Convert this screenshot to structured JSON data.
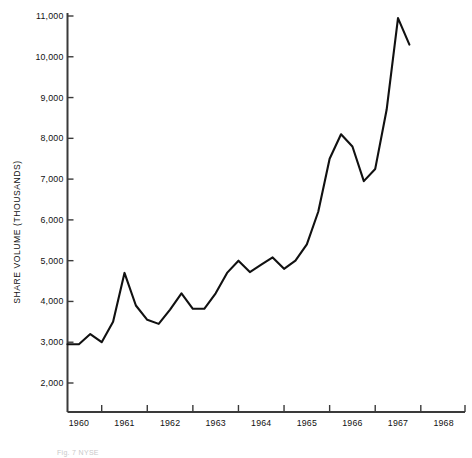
{
  "figure": {
    "caption_fragment": "Fig. 7  NYSE",
    "background_color": "#ffffff",
    "line_color": "#111111",
    "axis_color": "#3a3a3a"
  },
  "chart_data": {
    "type": "line",
    "title": "",
    "subtitle": "",
    "xlabel": "",
    "ylabel": "SHARE VOLUME (THOUSANDS)",
    "grid": false,
    "legend": "none",
    "ylim": [
      1500,
      11000
    ],
    "xlim": [
      1959.75,
      1968.25
    ],
    "y_ticks": [
      2000,
      3000,
      4000,
      5000,
      6000,
      7000,
      8000,
      9000,
      10000,
      11000
    ],
    "y_tick_labels": [
      "2,000",
      "3,000",
      "4,000",
      "5,000",
      "6,000",
      "7,000",
      "8,000",
      "9,000",
      "10,000",
      "11,000"
    ],
    "x_ticks": [
      1960,
      1961,
      1962,
      1963,
      1964,
      1965,
      1966,
      1967,
      1968
    ],
    "x_tick_labels": [
      "1960",
      "1961",
      "1962",
      "1963",
      "1964",
      "1965",
      "1966",
      "1967",
      "1968"
    ],
    "x_minor_ticks": [
      1960.5,
      1961.5,
      1962.5,
      1963.5,
      1964.5,
      1965.5,
      1966.5,
      1967.5
    ],
    "series": [
      {
        "name": "Share Volume",
        "x": [
          1959.75,
          1960.0,
          1960.25,
          1960.5,
          1960.75,
          1961.0,
          1961.25,
          1961.5,
          1961.75,
          1962.0,
          1962.25,
          1962.5,
          1962.75,
          1963.0,
          1963.25,
          1963.5,
          1963.75,
          1964.0,
          1964.25,
          1964.5,
          1964.75,
          1965.0,
          1965.25,
          1965.5,
          1965.75,
          1966.0,
          1966.25,
          1966.5,
          1966.75,
          1967.0,
          1967.25
        ],
        "values": [
          2950,
          2950,
          3200,
          3000,
          3500,
          4700,
          3900,
          3550,
          3450,
          3800,
          4200,
          3820,
          3820,
          4200,
          4700,
          5000,
          4720,
          4900,
          5080,
          4800,
          5000,
          5400,
          6200,
          7500,
          8100,
          7800,
          6950,
          7250,
          8700,
          10950,
          10300
        ]
      }
    ]
  }
}
